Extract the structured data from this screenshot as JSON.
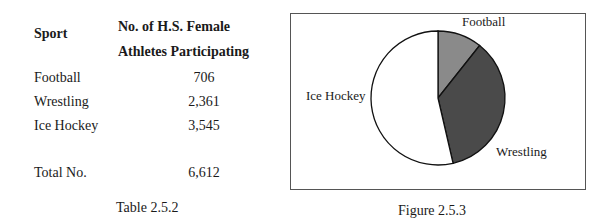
{
  "table": {
    "headers": {
      "sport": "Sport",
      "count_line1": "No. of H.S. Female",
      "count_line2": "Athletes Participating"
    },
    "rows": [
      {
        "sport": "Football",
        "count": "706"
      },
      {
        "sport": "Wrestling",
        "count": "2,361"
      },
      {
        "sport": "Ice Hockey",
        "count": "3,545"
      }
    ],
    "total": {
      "label": "Total No.",
      "count": "6,612"
    },
    "caption": "Table 2.5.2"
  },
  "figure": {
    "caption": "Figure 2.5.3",
    "labels": {
      "football": "Football",
      "wrestling": "Wrestling",
      "ice_hockey": "Ice Hockey"
    }
  },
  "chart_data": {
    "type": "pie",
    "title": "",
    "categories": [
      "Football",
      "Wrestling",
      "Ice Hockey"
    ],
    "values": [
      706,
      2361,
      3545
    ],
    "total": 6612,
    "colors": [
      "#8a8a8a",
      "#4a4a4a",
      "#ffffff"
    ],
    "legend": "none (direct labels)",
    "start_angle": "12 o'clock, clockwise"
  }
}
